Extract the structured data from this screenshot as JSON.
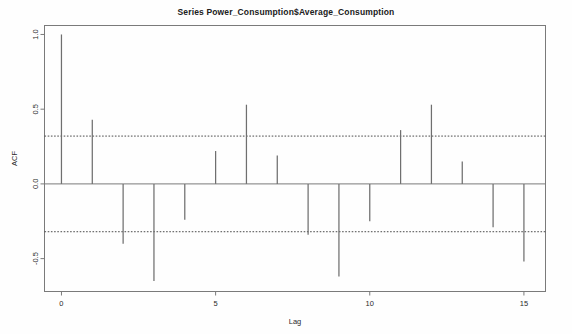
{
  "chart_data": {
    "type": "bar",
    "title": "Series  Power_Consumption$Average_Consumption",
    "xlabel": "Lag",
    "ylabel": "ACF",
    "categories": [
      0,
      1,
      2,
      3,
      4,
      5,
      6,
      7,
      8,
      9,
      10,
      11,
      12,
      13,
      14,
      15
    ],
    "values": [
      1.0,
      0.43,
      -0.4,
      -0.65,
      -0.24,
      0.22,
      0.53,
      0.19,
      -0.34,
      -0.62,
      -0.25,
      0.36,
      0.53,
      0.15,
      -0.29,
      -0.52
    ],
    "xlim": [
      -0.55,
      15.7
    ],
    "ylim": [
      -0.72,
      1.06
    ],
    "xticks": [
      0,
      5,
      10,
      15
    ],
    "xtick_labels": [
      "0",
      "5",
      "10",
      "15"
    ],
    "yticks": [
      1.0,
      0.5,
      0.0,
      -0.5
    ],
    "ytick_labels": [
      "1.0",
      "0.5",
      "0.0",
      "-0.5"
    ],
    "confidence_level": 0.32,
    "confidence_lines": [
      0.32,
      -0.32
    ],
    "grid": false,
    "legend": null,
    "series_color": "#6f6f6f",
    "axis_color": "#7a7a7a",
    "confidence_color": "#4a4a4a",
    "zero_line": 0.0
  },
  "figure": {
    "background_color": "#fefefe",
    "box_border": true
  }
}
